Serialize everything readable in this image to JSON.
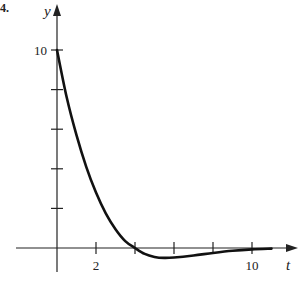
{
  "problem_marker": "4.",
  "chart_data": {
    "type": "line",
    "title": "",
    "xlabel": "t",
    "ylabel": "y",
    "x_ticks": [
      2,
      4,
      6,
      8,
      10
    ],
    "x_tick_labels": [
      {
        "value": 2,
        "label": "2"
      },
      {
        "value": 10,
        "label": "10"
      }
    ],
    "y_ticks": [
      2,
      4,
      6,
      8,
      10
    ],
    "y_tick_labels": [
      {
        "value": 10,
        "label": "10"
      }
    ],
    "xlim": [
      -1,
      12
    ],
    "ylim": [
      -1,
      11
    ],
    "grid": false,
    "legend": null,
    "series": [
      {
        "name": "y(t)",
        "x": [
          0,
          0.5,
          1,
          1.5,
          2,
          2.5,
          3,
          3.5,
          4,
          4.5,
          5,
          5.5,
          6,
          7,
          8,
          9,
          10,
          11
        ],
        "values": [
          10,
          7.6,
          5.7,
          4.1,
          2.8,
          1.75,
          0.95,
          0.35,
          0,
          -0.3,
          -0.45,
          -0.5,
          -0.48,
          -0.38,
          -0.25,
          -0.14,
          -0.07,
          -0.03
        ]
      }
    ]
  }
}
